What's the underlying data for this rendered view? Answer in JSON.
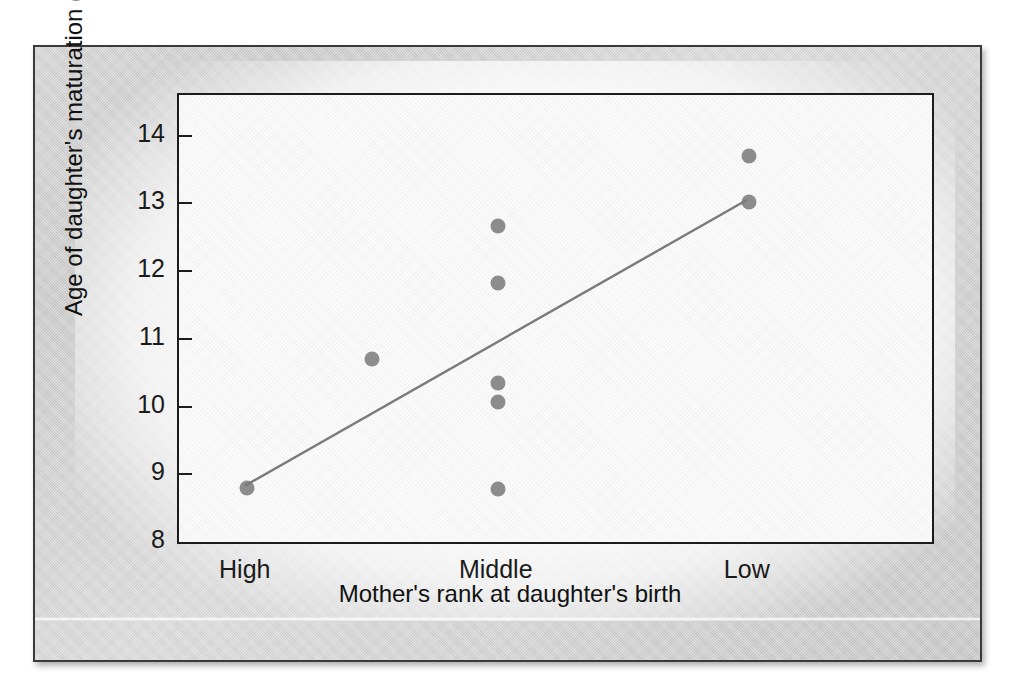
{
  "figure": {
    "frame_color": "#cfcfcf",
    "frame_border_color": "#3a3a3a",
    "plot_background": "#fbfbfb"
  },
  "chart_data": {
    "type": "scatter",
    "title": "",
    "xlabel": "Mother's rank at daughter's birth",
    "ylabel": "Age of daughter's maturation (years)",
    "categories": [
      "High",
      "Middle",
      "Low"
    ],
    "category_positions": [
      1,
      2,
      3
    ],
    "xlim": [
      0.73,
      3.73
    ],
    "ylim": [
      8,
      14.6
    ],
    "yticks": [
      8,
      9,
      10,
      11,
      12,
      13,
      14
    ],
    "ytick_labels": [
      "8",
      "9",
      "10",
      "11",
      "12",
      "13",
      "14"
    ],
    "grid": false,
    "legend": null,
    "point_color": "#8c8c8c",
    "point_size_px": 15,
    "line_color": "#7a7a7a",
    "points": [
      {
        "x_category": "High",
        "x": 1.0,
        "y": 8.8
      },
      {
        "x_category": "",
        "x": 1.5,
        "y": 10.7
      },
      {
        "x_category": "Middle",
        "x": 2.0,
        "y": 12.67
      },
      {
        "x_category": "Middle",
        "x": 2.0,
        "y": 11.83
      },
      {
        "x_category": "Middle",
        "x": 2.0,
        "y": 10.35
      },
      {
        "x_category": "Middle",
        "x": 2.0,
        "y": 10.07
      },
      {
        "x_category": "Middle",
        "x": 2.0,
        "y": 8.78
      },
      {
        "x_category": "Low",
        "x": 3.0,
        "y": 13.7
      },
      {
        "x_category": "Low",
        "x": 3.0,
        "y": 13.02
      }
    ],
    "trend_line": {
      "name": "regression line",
      "x_start": 1.0,
      "y_start": 8.8,
      "x_end": 3.0,
      "y_end": 13.02
    }
  }
}
